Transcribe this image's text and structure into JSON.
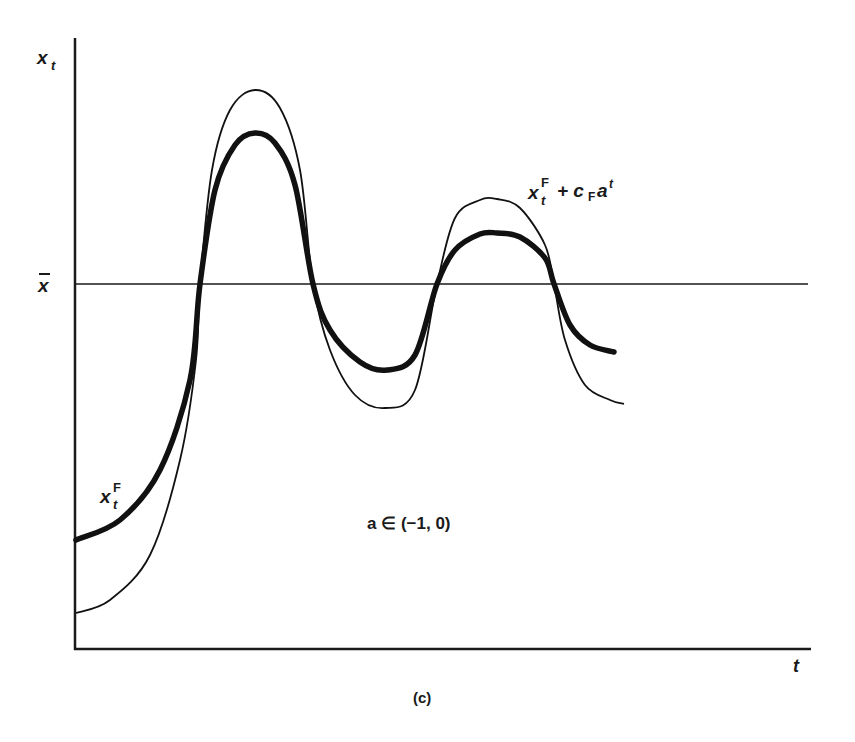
{
  "chart_data": {
    "type": "line",
    "title": "",
    "panel_label": "(c)",
    "xlabel": "t",
    "ylabel": "x_t",
    "reference_line": {
      "label": "x̄",
      "y_px": 284
    },
    "annotation": "a ∈ (−1, 0)",
    "grid": false,
    "legend": "inline labels",
    "series": [
      {
        "name": "x_t^F",
        "style": "thick",
        "points_px": [
          [
            76,
            540
          ],
          [
            120,
            520
          ],
          [
            160,
            470
          ],
          [
            190,
            380
          ],
          [
            200,
            284
          ],
          [
            215,
            190
          ],
          [
            235,
            145
          ],
          [
            255,
            133
          ],
          [
            275,
            143
          ],
          [
            295,
            185
          ],
          [
            313,
            284
          ],
          [
            330,
            330
          ],
          [
            360,
            362
          ],
          [
            387,
            370
          ],
          [
            415,
            355
          ],
          [
            437,
            284
          ],
          [
            455,
            250
          ],
          [
            480,
            234
          ],
          [
            497,
            233
          ],
          [
            520,
            237
          ],
          [
            545,
            258
          ],
          [
            554,
            284
          ],
          [
            570,
            325
          ],
          [
            590,
            345
          ],
          [
            614,
            352
          ]
        ]
      },
      {
        "name": "x_t^F + c_F a^t",
        "style": "thin",
        "points_px": [
          [
            76,
            613
          ],
          [
            110,
            600
          ],
          [
            150,
            555
          ],
          [
            180,
            460
          ],
          [
            196,
            360
          ],
          [
            200,
            284
          ],
          [
            212,
            170
          ],
          [
            230,
            110
          ],
          [
            255,
            90
          ],
          [
            280,
            108
          ],
          [
            300,
            170
          ],
          [
            313,
            284
          ],
          [
            330,
            350
          ],
          [
            355,
            395
          ],
          [
            385,
            408
          ],
          [
            415,
            390
          ],
          [
            437,
            284
          ],
          [
            455,
            218
          ],
          [
            480,
            200
          ],
          [
            497,
            199
          ],
          [
            520,
            208
          ],
          [
            545,
            245
          ],
          [
            554,
            284
          ],
          [
            565,
            340
          ],
          [
            585,
            385
          ],
          [
            610,
            400
          ],
          [
            624,
            404
          ]
        ]
      }
    ],
    "labels": {
      "y_axis": "x",
      "y_axis_sub": "t",
      "xbar": "x",
      "t_axis": "t",
      "thick_label_base": "x",
      "thick_label_sup": "F",
      "thick_label_sub": "t",
      "thin_label_base": "x",
      "thin_label_sup": "F",
      "thin_label_sub": "t",
      "thin_label_rest": "+ c",
      "thin_label_c_sub": "F",
      "thin_label_a": "a",
      "thin_label_a_sup": "t",
      "annotation": "a ∈ (−1, 0)",
      "caption": "(c)"
    }
  }
}
